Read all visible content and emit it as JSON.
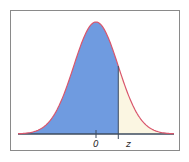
{
  "chart_data": {
    "type": "area",
    "title": "",
    "xlabel": "",
    "ylabel": "",
    "tick_labels": [
      "0",
      "z"
    ],
    "x_range": [
      -3.5,
      3.5
    ],
    "z_value": 1.0,
    "mean": 0,
    "sd": 1,
    "shaded_region": {
      "from": "-inf",
      "to": "z"
    },
    "grid": false,
    "legend": null
  },
  "labels": {
    "zero": "0",
    "z": "z"
  },
  "colors": {
    "fill": "#6f9be0",
    "curve": "#d9566c",
    "tail_fill": "#fbf6e2",
    "baseline": "#3c4b5e",
    "frame": "#8a8a8a"
  }
}
